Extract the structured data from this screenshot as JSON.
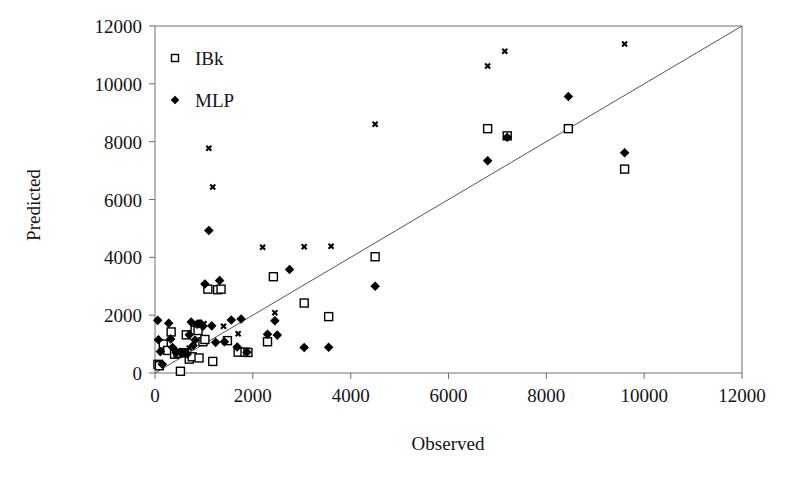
{
  "chart_data": {
    "type": "scatter",
    "title": "",
    "xlabel": "Observed",
    "ylabel": "Predicted",
    "xlim": [
      0,
      12000
    ],
    "ylim": [
      0,
      12000
    ],
    "xticks": [
      0,
      2000,
      4000,
      6000,
      8000,
      10000,
      12000
    ],
    "yticks": [
      0,
      2000,
      4000,
      6000,
      8000,
      10000,
      12000
    ],
    "xticklabels": [
      "0",
      "2000",
      "4000",
      "6000",
      "8000",
      "10000",
      "12000"
    ],
    "yticklabels": [
      "0",
      "2000",
      "4000",
      "6000",
      "8000",
      "10000",
      "12000"
    ],
    "grid": false,
    "legend_position": "upper-left-inside",
    "reference_line": {
      "description": "y = x diagonal identity line",
      "from": [
        0,
        0
      ],
      "to": [
        12000,
        12000
      ]
    },
    "series": [
      {
        "name": "IBk",
        "marker": "open-square",
        "color": "#000000",
        "points": [
          [
            60,
            300
          ],
          [
            90,
            250
          ],
          [
            170,
            1000
          ],
          [
            260,
            780
          ],
          [
            330,
            1420
          ],
          [
            400,
            650
          ],
          [
            470,
            690
          ],
          [
            520,
            60
          ],
          [
            600,
            700
          ],
          [
            640,
            1320
          ],
          [
            700,
            480
          ],
          [
            760,
            560
          ],
          [
            820,
            1480
          ],
          [
            880,
            1470
          ],
          [
            900,
            520
          ],
          [
            980,
            1080
          ],
          [
            1020,
            1160
          ],
          [
            1080,
            2900
          ],
          [
            1180,
            400
          ],
          [
            1280,
            2880
          ],
          [
            1350,
            2900
          ],
          [
            1480,
            1120
          ],
          [
            1700,
            720
          ],
          [
            1840,
            720
          ],
          [
            1900,
            710
          ],
          [
            2300,
            1080
          ],
          [
            2420,
            3330
          ],
          [
            3050,
            2420
          ],
          [
            3550,
            1950
          ],
          [
            4500,
            4020
          ],
          [
            6800,
            8450
          ],
          [
            7200,
            8200
          ],
          [
            8450,
            8450
          ],
          [
            9600,
            7050
          ]
        ]
      },
      {
        "name": "MLP",
        "marker": "filled-diamond",
        "color": "#000000",
        "points": [
          [
            55,
            1820
          ],
          [
            70,
            1150
          ],
          [
            110,
            740
          ],
          [
            150,
            300
          ],
          [
            280,
            1720
          ],
          [
            320,
            1180
          ],
          [
            360,
            880
          ],
          [
            430,
            700
          ],
          [
            520,
            720
          ],
          [
            560,
            690
          ],
          [
            620,
            700
          ],
          [
            660,
            660
          ],
          [
            700,
            1320
          ],
          [
            740,
            1760
          ],
          [
            780,
            950
          ],
          [
            820,
            1140
          ],
          [
            860,
            1690
          ],
          [
            900,
            1700
          ],
          [
            940,
            1700
          ],
          [
            980,
            1620
          ],
          [
            1020,
            3080
          ],
          [
            1100,
            4930
          ],
          [
            1160,
            1630
          ],
          [
            1240,
            1060
          ],
          [
            1320,
            3200
          ],
          [
            1420,
            1080
          ],
          [
            1560,
            1830
          ],
          [
            1680,
            900
          ],
          [
            1760,
            1870
          ],
          [
            1880,
            720
          ],
          [
            2300,
            1340
          ],
          [
            2450,
            1810
          ],
          [
            2500,
            1310
          ],
          [
            2750,
            3580
          ],
          [
            3050,
            880
          ],
          [
            3550,
            890
          ],
          [
            4500,
            3000
          ],
          [
            6800,
            7340
          ],
          [
            7200,
            8150
          ],
          [
            8450,
            9560
          ],
          [
            9600,
            7620
          ]
        ]
      },
      {
        "name": "unlabeled-x-markers",
        "marker": "x-cross",
        "color": "#000000",
        "points": [
          [
            700,
            860
          ],
          [
            1000,
            1700
          ],
          [
            1100,
            7770
          ],
          [
            1180,
            6430
          ],
          [
            1400,
            1620
          ],
          [
            1700,
            1360
          ],
          [
            2200,
            4350
          ],
          [
            2450,
            2080
          ],
          [
            3050,
            4370
          ],
          [
            3600,
            4380
          ],
          [
            4500,
            8600
          ],
          [
            6800,
            10620
          ],
          [
            7150,
            11130
          ],
          [
            9600,
            11380
          ]
        ]
      }
    ]
  },
  "legend": {
    "items": [
      {
        "label": "IBk",
        "marker": "open-square"
      },
      {
        "label": "MLP",
        "marker": "filled-diamond"
      }
    ]
  }
}
